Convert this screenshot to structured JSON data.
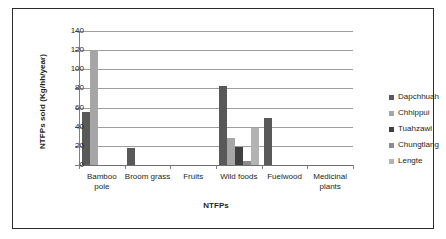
{
  "chart_data": {
    "type": "bar",
    "title": "",
    "xlabel": "NTFPs",
    "ylabel": "NTFPs sold (Kg/hh/year)",
    "categories": [
      "Bamboo pole",
      "Broom grass",
      "Fruits",
      "Wild foods",
      "Fuelwood",
      "Medicinal plants"
    ],
    "ylim": [
      0,
      140
    ],
    "ytick_labels": [
      "140",
      "120",
      "100",
      "80",
      "60",
      "40",
      "20",
      "0"
    ],
    "ytick_values": [
      140,
      120,
      100,
      80,
      60,
      40,
      20,
      0
    ],
    "grid": true,
    "legend_position": "right",
    "series": [
      {
        "name": "Dapchhuah",
        "color": "#595959",
        "values": [
          55,
          18,
          0,
          83,
          49,
          0
        ]
      },
      {
        "name": "Chhippui",
        "color": "#a6a6a6",
        "values": [
          120,
          0,
          0,
          28,
          0,
          0
        ]
      },
      {
        "name": "Tuahzawl",
        "color": "#404040",
        "values": [
          0,
          0,
          0,
          19,
          0,
          0
        ]
      },
      {
        "name": "Chungtlang",
        "color": "#8c8c8c",
        "values": [
          0,
          0,
          0,
          4,
          0,
          0
        ]
      },
      {
        "name": "Lengte",
        "color": "#b3b3b3",
        "values": [
          0,
          0,
          0,
          39,
          0,
          0
        ]
      }
    ]
  },
  "axis": {
    "y_title": "NTFPs sold (Kg/hh/year)",
    "x_title": "NTFPs"
  },
  "categories": {
    "c0_line1": "Bamboo",
    "c0_line2": "pole",
    "c1_line1": "Broom grass",
    "c1_line2": "",
    "c2_line1": "Fruits",
    "c2_line2": "",
    "c3_line1": "Wild foods",
    "c3_line2": "",
    "c4_line1": "Fuelwood",
    "c4_line2": "",
    "c5_line1": "Medicinal",
    "c5_line2": "plants"
  },
  "yticks": {
    "t140": "140",
    "t120": "120",
    "t100": "100",
    "t80": "80",
    "t60": "60",
    "t40": "40",
    "t20": "20",
    "t0": "0"
  },
  "legend": {
    "items": [
      {
        "label": "Dapchhuah",
        "color": "#595959"
      },
      {
        "label": "Chhippui",
        "color": "#a6a6a6"
      },
      {
        "label": "Tuahzawl",
        "color": "#404040"
      },
      {
        "label": "Chungtlang",
        "color": "#8c8c8c"
      },
      {
        "label": "Lengte",
        "color": "#b3b3b3"
      }
    ]
  }
}
